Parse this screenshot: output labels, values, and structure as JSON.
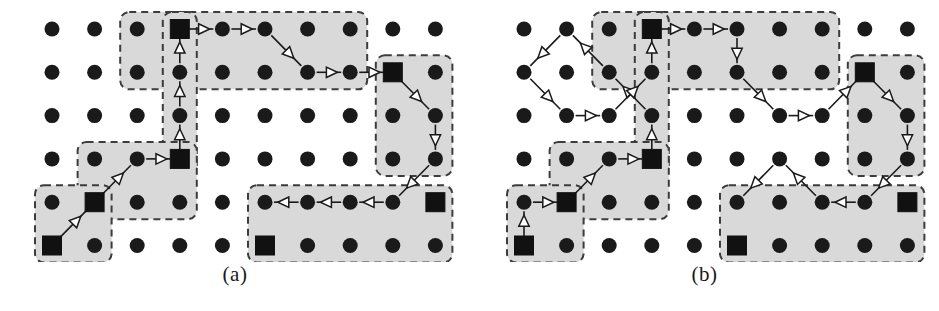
{
  "figure": {
    "background_color": "#ffffff",
    "dot_color": "#1a1a1a",
    "square_color": "#111111",
    "region_fill": "#d9d9d9",
    "region_stroke": "#3c3c3c",
    "edge_color": "#1a1a1a",
    "arrowhead_fill": "#ffffff",
    "arrowhead_stroke": "#1a1a1a",
    "caption_color": "#1a1a1a"
  },
  "panels": [
    {
      "id": "panel-a",
      "caption": "(a)",
      "origin_x": 52,
      "origin_y": 29,
      "col_step": 42.6,
      "row_step": 43.3,
      "cols": 10,
      "rows": 6,
      "dot_radius": 7.5,
      "square_size": 19,
      "regions": [
        {
          "name": "region-top-strip",
          "cells": [
            [
              3,
              1
            ],
            [
              3,
              2
            ],
            [
              4,
              1
            ],
            [
              5,
              1
            ],
            [
              6,
              1
            ],
            [
              7,
              1
            ],
            [
              8,
              1
            ],
            [
              4,
              2
            ],
            [
              5,
              2
            ],
            [
              6,
              2
            ],
            [
              7,
              2
            ],
            [
              8,
              2
            ]
          ]
        },
        {
          "name": "region-head-tall",
          "cells": [
            [
              4,
              1
            ],
            [
              4,
              2
            ],
            [
              4,
              3
            ],
            [
              4,
              4
            ]
          ]
        },
        {
          "name": "region-right-column",
          "cells": [
            [
              9,
              2
            ],
            [
              9,
              3
            ],
            [
              9,
              4
            ],
            [
              10,
              2
            ],
            [
              10,
              3
            ],
            [
              10,
              4
            ]
          ]
        },
        {
          "name": "region-mid-left",
          "cells": [
            [
              2,
              4
            ],
            [
              3,
              4
            ],
            [
              4,
              4
            ],
            [
              2,
              5
            ],
            [
              3,
              5
            ],
            [
              4,
              5
            ]
          ]
        },
        {
          "name": "region-far-left",
          "cells": [
            [
              1,
              5
            ],
            [
              2,
              5
            ],
            [
              1,
              6
            ],
            [
              2,
              6
            ]
          ]
        },
        {
          "name": "region-bottom-strip",
          "cells": [
            [
              6,
              5
            ],
            [
              7,
              5
            ],
            [
              8,
              5
            ],
            [
              9,
              5
            ],
            [
              10,
              5
            ],
            [
              6,
              6
            ],
            [
              7,
              6
            ],
            [
              8,
              6
            ],
            [
              9,
              6
            ],
            [
              10,
              6
            ]
          ]
        }
      ],
      "dots": "all-grid-nodes",
      "squares": [
        {
          "name": "landmark-square-top",
          "col": 4,
          "row": 1
        },
        {
          "name": "landmark-square-right-upper",
          "col": 9,
          "row": 2
        },
        {
          "name": "landmark-square-mid",
          "col": 4,
          "row": 4
        },
        {
          "name": "landmark-square-lower-left",
          "col": 2,
          "row": 5
        },
        {
          "name": "landmark-square-bottom-left",
          "col": 1,
          "row": 6
        },
        {
          "name": "landmark-square-right-lower",
          "col": 10,
          "row": 5
        },
        {
          "name": "landmark-square-bottom-mid",
          "col": 6,
          "row": 6
        }
      ],
      "edges": [
        {
          "name": "edge-a1",
          "from": [
            1,
            6
          ],
          "to": [
            2,
            5
          ]
        },
        {
          "name": "edge-a2",
          "from": [
            2,
            5
          ],
          "to": [
            3,
            4
          ]
        },
        {
          "name": "edge-a3",
          "from": [
            3,
            4
          ],
          "to": [
            4,
            4
          ]
        },
        {
          "name": "edge-a4",
          "from": [
            4,
            4
          ],
          "to": [
            4,
            3
          ]
        },
        {
          "name": "edge-a5",
          "from": [
            4,
            3
          ],
          "to": [
            4,
            2
          ]
        },
        {
          "name": "edge-a6",
          "from": [
            4,
            2
          ],
          "to": [
            4,
            1
          ]
        },
        {
          "name": "edge-a7",
          "from": [
            4,
            1
          ],
          "to": [
            5,
            1
          ]
        },
        {
          "name": "edge-a8",
          "from": [
            5,
            1
          ],
          "to": [
            6,
            1
          ]
        },
        {
          "name": "edge-a9",
          "from": [
            6,
            1
          ],
          "to": [
            7,
            2
          ]
        },
        {
          "name": "edge-a10",
          "from": [
            7,
            2
          ],
          "to": [
            8,
            2
          ]
        },
        {
          "name": "edge-a11",
          "from": [
            8,
            2
          ],
          "to": [
            9,
            2
          ]
        },
        {
          "name": "edge-a12",
          "from": [
            9,
            2
          ],
          "to": [
            10,
            3
          ]
        },
        {
          "name": "edge-a13",
          "from": [
            10,
            3
          ],
          "to": [
            10,
            4
          ]
        },
        {
          "name": "edge-a14",
          "from": [
            10,
            4
          ],
          "to": [
            9,
            5
          ]
        },
        {
          "name": "edge-a15",
          "from": [
            9,
            5
          ],
          "to": [
            8,
            5
          ]
        },
        {
          "name": "edge-a16",
          "from": [
            8,
            5
          ],
          "to": [
            7,
            5
          ]
        },
        {
          "name": "edge-a17",
          "from": [
            7,
            5
          ],
          "to": [
            6,
            5
          ]
        }
      ]
    },
    {
      "id": "panel-b",
      "caption": "(b)",
      "origin_x": 524,
      "origin_y": 29,
      "col_step": 42.6,
      "row_step": 43.3,
      "cols": 10,
      "rows": 6,
      "dot_radius": 7.5,
      "square_size": 19,
      "regions": [
        {
          "name": "region-top-strip",
          "cells": [
            [
              3,
              1
            ],
            [
              3,
              2
            ],
            [
              4,
              1
            ],
            [
              5,
              1
            ],
            [
              6,
              1
            ],
            [
              7,
              1
            ],
            [
              8,
              1
            ],
            [
              4,
              2
            ],
            [
              5,
              2
            ],
            [
              6,
              2
            ],
            [
              7,
              2
            ],
            [
              8,
              2
            ]
          ]
        },
        {
          "name": "region-head-tall",
          "cells": [
            [
              4,
              1
            ],
            [
              4,
              2
            ],
            [
              4,
              3
            ],
            [
              4,
              4
            ]
          ]
        },
        {
          "name": "region-right-column",
          "cells": [
            [
              9,
              2
            ],
            [
              9,
              3
            ],
            [
              9,
              4
            ],
            [
              10,
              2
            ],
            [
              10,
              3
            ],
            [
              10,
              4
            ]
          ]
        },
        {
          "name": "region-mid-left",
          "cells": [
            [
              2,
              4
            ],
            [
              3,
              4
            ],
            [
              4,
              4
            ],
            [
              2,
              5
            ],
            [
              3,
              5
            ],
            [
              4,
              5
            ]
          ]
        },
        {
          "name": "region-far-left",
          "cells": [
            [
              1,
              5
            ],
            [
              2,
              5
            ],
            [
              1,
              6
            ],
            [
              2,
              6
            ]
          ]
        },
        {
          "name": "region-bottom-strip",
          "cells": [
            [
              6,
              5
            ],
            [
              7,
              5
            ],
            [
              8,
              5
            ],
            [
              9,
              5
            ],
            [
              10,
              5
            ],
            [
              6,
              6
            ],
            [
              7,
              6
            ],
            [
              8,
              6
            ],
            [
              9,
              6
            ],
            [
              10,
              6
            ]
          ]
        }
      ],
      "dots": "all-grid-nodes",
      "squares": [
        {
          "name": "landmark-square-top",
          "col": 4,
          "row": 1
        },
        {
          "name": "landmark-square-right-upper",
          "col": 9,
          "row": 2
        },
        {
          "name": "landmark-square-mid",
          "col": 4,
          "row": 4
        },
        {
          "name": "landmark-square-lower-left",
          "col": 2,
          "row": 5
        },
        {
          "name": "landmark-square-bottom-left",
          "col": 1,
          "row": 6
        },
        {
          "name": "landmark-square-right-lower",
          "col": 10,
          "row": 5
        },
        {
          "name": "landmark-square-bottom-mid",
          "col": 6,
          "row": 6
        }
      ],
      "edges": [
        {
          "name": "edge-b1",
          "from": [
            1,
            6
          ],
          "to": [
            1,
            5
          ]
        },
        {
          "name": "edge-b2",
          "from": [
            1,
            5
          ],
          "to": [
            2,
            5
          ]
        },
        {
          "name": "edge-b3",
          "from": [
            2,
            5
          ],
          "to": [
            3,
            4
          ]
        },
        {
          "name": "edge-b4",
          "from": [
            3,
            4
          ],
          "to": [
            4,
            4
          ]
        },
        {
          "name": "edge-b5",
          "from": [
            4,
            4
          ],
          "to": [
            4,
            3
          ]
        },
        {
          "name": "edge-b6",
          "from": [
            4,
            3
          ],
          "to": [
            3,
            2
          ]
        },
        {
          "name": "edge-b7",
          "from": [
            3,
            2
          ],
          "to": [
            2,
            1
          ]
        },
        {
          "name": "edge-b8",
          "from": [
            2,
            1
          ],
          "to": [
            1,
            2
          ]
        },
        {
          "name": "edge-b9",
          "from": [
            1,
            2
          ],
          "to": [
            2,
            3
          ]
        },
        {
          "name": "edge-b10",
          "from": [
            2,
            3
          ],
          "to": [
            3,
            3
          ]
        },
        {
          "name": "edge-b11",
          "from": [
            3,
            3
          ],
          "to": [
            4,
            2
          ]
        },
        {
          "name": "edge-b12",
          "from": [
            4,
            2
          ],
          "to": [
            4,
            1
          ]
        },
        {
          "name": "edge-b13",
          "from": [
            4,
            1
          ],
          "to": [
            5,
            1
          ]
        },
        {
          "name": "edge-b14",
          "from": [
            5,
            1
          ],
          "to": [
            6,
            1
          ]
        },
        {
          "name": "edge-b15",
          "from": [
            6,
            1
          ],
          "to": [
            6,
            2
          ]
        },
        {
          "name": "edge-b16",
          "from": [
            6,
            2
          ],
          "to": [
            7,
            3
          ]
        },
        {
          "name": "edge-b17",
          "from": [
            7,
            3
          ],
          "to": [
            8,
            3
          ]
        },
        {
          "name": "edge-b18",
          "from": [
            8,
            3
          ],
          "to": [
            9,
            2
          ]
        },
        {
          "name": "edge-b19",
          "from": [
            9,
            2
          ],
          "to": [
            10,
            3
          ]
        },
        {
          "name": "edge-b20",
          "from": [
            10,
            3
          ],
          "to": [
            10,
            4
          ]
        },
        {
          "name": "edge-b21",
          "from": [
            10,
            4
          ],
          "to": [
            9,
            5
          ]
        },
        {
          "name": "edge-b22",
          "from": [
            9,
            5
          ],
          "to": [
            8,
            5
          ]
        },
        {
          "name": "edge-b23",
          "from": [
            8,
            5
          ],
          "to": [
            7,
            4
          ]
        },
        {
          "name": "edge-b24",
          "from": [
            7,
            4
          ],
          "to": [
            6,
            5
          ]
        }
      ]
    }
  ]
}
